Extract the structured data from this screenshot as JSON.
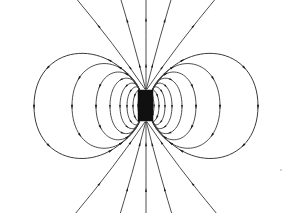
{
  "figure": {
    "caption": "",
    "background_color": "#ffffff",
    "line_color": "#3a3a3a",
    "arrow_color": "#1a1a1a",
    "magnet_color": "#101010",
    "width": 294,
    "height": 213
  },
  "chart_data": {
    "type": "diagram",
    "subtype": "vector-field-line-diagram",
    "xlabel": "",
    "ylabel": "",
    "xlim": [
      0,
      294
    ],
    "ylim": [
      0,
      213
    ],
    "grid": false,
    "legend": null,
    "annotations": [],
    "center": {
      "x": 146,
      "y": 106
    },
    "magnet": {
      "shape": "rectangle",
      "x": 138,
      "y": 90,
      "width": 15,
      "height": 31,
      "north_pole_y": 90,
      "south_pole_y": 121,
      "fill": "#101010"
    },
    "symmetry": "mirror about vertical axis x=146 and horizontal axis y=106",
    "loops_per_side": 8,
    "radial_lines_top": 5,
    "radial_lines_bottom": 5,
    "arrow_direction": "out of north pole (top), into south pole (bottom)",
    "loop_half_widths_right": [
      8,
      13,
      19,
      26,
      36,
      50,
      74,
      112
    ],
    "loop_half_widths_left": [
      8,
      13,
      19,
      26,
      36,
      50,
      74,
      112
    ],
    "loop_half_heights": [
      17,
      22,
      28,
      35,
      44,
      55,
      70,
      88
    ],
    "radial_line_angles_top_deg": [
      -78,
      -60,
      -90,
      -102,
      -120
    ],
    "radial_line_angles_bottom_deg": [
      78,
      60,
      90,
      102,
      120
    ],
    "series": [
      {
        "name": "closed-dipole-loops-right",
        "count": 8
      },
      {
        "name": "closed-dipole-loops-left",
        "count": 8
      },
      {
        "name": "open-radial-lines-top",
        "count": 5
      },
      {
        "name": "open-radial-lines-bottom",
        "count": 5
      }
    ]
  }
}
